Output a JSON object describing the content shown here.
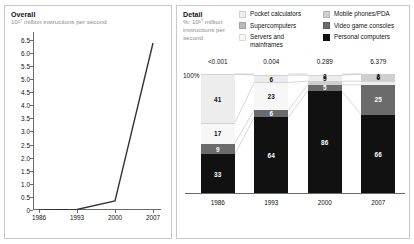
{
  "overall": {
    "title": "Overall",
    "subtitle": "10¹⁷ million instructions per second"
  },
  "detail": {
    "title": "Detail",
    "subtitle": "%: 10¹⁷ million instructions per second",
    "pct_label": "100%",
    "arrow_glyph": "→"
  },
  "legend": {
    "items": [
      {
        "label": "Pocket calculators",
        "color": "#ededed",
        "name": "pocket-calculators"
      },
      {
        "label": "Supercomputers",
        "color": "#b9b9b9",
        "name": "supercomputers"
      },
      {
        "label": "Servers and\nmainframes",
        "color": "#f7f7f7",
        "name": "servers-and-mainframes"
      },
      {
        "label": "Mobile phones/PDA",
        "color": "#cfcfcf",
        "name": "mobile-phones-pda"
      },
      {
        "label": "Video game consoles",
        "color": "#6b6b6b",
        "name": "video-game-consoles"
      },
      {
        "label": "Personal computers",
        "color": "#111111",
        "name": "personal-computers"
      }
    ]
  },
  "chart_data": [
    {
      "type": "line",
      "title": "Overall",
      "ylabel": "10¹⁷ million instructions per second",
      "xlabel": "",
      "x": [
        "1986",
        "1993",
        "2000",
        "2007"
      ],
      "categories": [
        "1986",
        "1993",
        "2000",
        "2007"
      ],
      "values": [
        0.0,
        0.02,
        0.35,
        6.379
      ],
      "yticks": [
        "0",
        "0.5",
        "1.0",
        "1.5",
        "2.0",
        "2.5",
        "3.0",
        "3.5",
        "4.0",
        "4.5",
        "5.0",
        "5.5",
        "6.0",
        "6.5"
      ],
      "ylim": [
        0,
        6.8
      ],
      "grid": false,
      "legend": "none"
    },
    {
      "type": "bar",
      "title": "Detail",
      "subtitle": "%: 10¹⁷ million instructions per second",
      "stacked": true,
      "normalized_to": "100%",
      "categories": [
        "1986",
        "1993",
        "2000",
        "2007"
      ],
      "totals": [
        "<0.001",
        "0.004",
        "0.289",
        "6.379"
      ],
      "ylabel": "%",
      "xlabel": "",
      "ylim": [
        0,
        100
      ],
      "grid": false,
      "legend": "top",
      "series": [
        {
          "name": "Pocket calculators",
          "color": "#ededed",
          "values": [
            41,
            6,
            5,
            6
          ]
        },
        {
          "name": "Servers and mainframes",
          "color": "#f7f7f7",
          "values": [
            17,
            23,
            3,
            3
          ]
        },
        {
          "name": "Supercomputers",
          "color": "#b9b9b9",
          "values": [
            0,
            0,
            0,
            0
          ]
        },
        {
          "name": "Mobile phones/PDA",
          "color": "#cfcfcf",
          "values": [
            0,
            1,
            1,
            0
          ]
        },
        {
          "name": "Video game consoles",
          "color": "#6b6b6b",
          "values": [
            9,
            6,
            5,
            25
          ]
        },
        {
          "name": "Personal computers",
          "color": "#111111",
          "values": [
            33,
            64,
            86,
            66
          ]
        }
      ],
      "bars": [
        {
          "year": "1986",
          "total": "<0.001",
          "segments": [
            {
              "label": "41",
              "value": 41,
              "color": "#ededed",
              "text": "#111111",
              "series": "Pocket calculators"
            },
            {
              "label": "17",
              "value": 17,
              "color": "#f7f7f7",
              "text": "#111111",
              "series": "Servers and mainframes"
            },
            {
              "label": "9",
              "value": 9,
              "color": "#6b6b6b",
              "text": "#ffffff",
              "series": "Video game consoles"
            },
            {
              "label": "33",
              "value": 33,
              "color": "#111111",
              "text": "#ffffff",
              "series": "Personal computers"
            }
          ]
        },
        {
          "year": "1993",
          "total": "0.004",
          "segments": [
            {
              "label": "6",
              "value": 6,
              "color": "#ededed",
              "text": "#111111",
              "series": "Pocket calculators"
            },
            {
              "label": "23",
              "value": 23,
              "color": "#f7f7f7",
              "text": "#111111",
              "series": "Servers and mainframes"
            },
            {
              "label": "6",
              "value": 6,
              "color": "#6b6b6b",
              "text": "#ffffff",
              "series": "Video game consoles"
            },
            {
              "label": "64",
              "value": 64,
              "color": "#111111",
              "text": "#ffffff",
              "series": "Personal computers"
            }
          ]
        },
        {
          "year": "2000",
          "total": "0.289",
          "segments": [
            {
              "label": "5",
              "value": 5,
              "color": "#ededed",
              "text": "#111111",
              "series": "Pocket calculators"
            },
            {
              "label": "3",
              "value": 3,
              "color": "#cfcfcf",
              "text": "#111111",
              "series": "Mobile phones/PDA"
            },
            {
              "label": "5",
              "value": 5,
              "color": "#6b6b6b",
              "text": "#ffffff",
              "series": "Video game consoles"
            },
            {
              "label": "86",
              "value": 86,
              "color": "#111111",
              "text": "#ffffff",
              "series": "Personal computers"
            }
          ]
        },
        {
          "year": "2007",
          "total": "6.379",
          "segments": [
            {
              "label": "6",
              "value": 6,
              "color": "#cfcfcf",
              "text": "#111111",
              "series": "Mobile phones/PDA"
            },
            {
              "label": "3",
              "value": 3,
              "color": "#ededed",
              "text": "#111111",
              "series": "Pocket calculators"
            },
            {
              "label": "25",
              "value": 25,
              "color": "#6b6b6b",
              "text": "#ffffff",
              "series": "Video game consoles"
            },
            {
              "label": "66",
              "value": 66,
              "color": "#111111",
              "text": "#ffffff",
              "series": "Personal computers"
            }
          ]
        }
      ]
    }
  ]
}
